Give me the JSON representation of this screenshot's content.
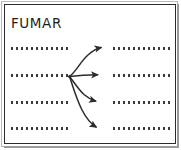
{
  "diagram": {
    "title": "FUMAR",
    "type": "concept-map-worksheet",
    "colors": {
      "ink": "#2b2b2b",
      "dotted_line": "#3a3a3a",
      "frame_outer": "#b9b9b9",
      "frame_inner": "#2b2b2b",
      "background": "#ffffff"
    },
    "blank_lines_left": [
      {
        "id": "left-line-1",
        "text": ""
      },
      {
        "id": "left-line-2",
        "text": ""
      },
      {
        "id": "left-line-3",
        "text": ""
      },
      {
        "id": "left-line-4",
        "text": ""
      }
    ],
    "blank_lines_right": [
      {
        "id": "right-line-1",
        "text": ""
      },
      {
        "id": "right-line-2",
        "text": ""
      },
      {
        "id": "right-line-3",
        "text": ""
      },
      {
        "id": "right-line-4",
        "text": ""
      }
    ],
    "arrows": [
      {
        "id": "arrow-1",
        "from": "left-line-2",
        "to": "right-line-1",
        "direction": "up-right"
      },
      {
        "id": "arrow-2",
        "from": "left-line-2",
        "to": "right-line-2",
        "direction": "right"
      },
      {
        "id": "arrow-3",
        "from": "left-line-2",
        "to": "right-line-3",
        "direction": "down-right"
      },
      {
        "id": "arrow-4",
        "from": "left-line-2",
        "to": "right-line-4",
        "direction": "down-right"
      }
    ],
    "node": {
      "id": "hub-node",
      "x": 69,
      "y": 76
    }
  }
}
